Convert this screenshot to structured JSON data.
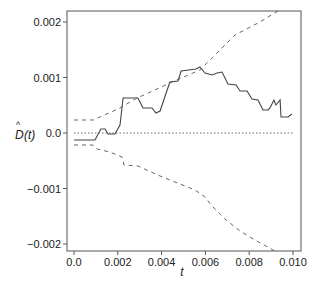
{
  "chart_data": {
    "type": "line",
    "title": "",
    "xlabel": "t",
    "ylabel": "D̂(t)",
    "xlim": [
      0.0,
      0.01
    ],
    "ylim": [
      -0.0021,
      0.0022
    ],
    "grid": false,
    "legend": null,
    "x_ticks": [
      {
        "value": 0.0,
        "label": "0.0"
      },
      {
        "value": 0.002,
        "label": "0.002"
      },
      {
        "value": 0.004,
        "label": "0.004"
      },
      {
        "value": 0.006,
        "label": "0.006"
      },
      {
        "value": 0.008,
        "label": "0.008"
      },
      {
        "value": 0.01,
        "label": "0.010"
      }
    ],
    "y_ticks": [
      {
        "value": 0.002,
        "label": "0.002"
      },
      {
        "value": 0.001,
        "label": "0.001"
      },
      {
        "value": 0.0,
        "label": "0.0"
      },
      {
        "value": -0.001,
        "label": "−0.001"
      },
      {
        "value": -0.002,
        "label": "−0.002"
      }
    ],
    "series": [
      {
        "name": "estimate",
        "style": "solid",
        "color": "#444444",
        "points": [
          [
            0.0,
            -0.000126
          ],
          [
            0.00096,
            -0.000126
          ],
          [
            0.00123,
            7.2e-05
          ],
          [
            0.00142,
            7.2e-05
          ],
          [
            0.00155,
            -1.8e-05
          ],
          [
            0.00187,
            -1.8e-05
          ],
          [
            0.0021,
            0.000144
          ],
          [
            0.00224,
            0.000631
          ],
          [
            0.00292,
            0.000631
          ],
          [
            0.00315,
            0.00045
          ],
          [
            0.00356,
            0.00045
          ],
          [
            0.00374,
            0.00036
          ],
          [
            0.00393,
            0.000396
          ],
          [
            0.00416,
            0.000667
          ],
          [
            0.00438,
            0.000919
          ],
          [
            0.00475,
            0.000937
          ],
          [
            0.00489,
            0.001117
          ],
          [
            0.00557,
            0.001153
          ],
          [
            0.00575,
            0.001189
          ],
          [
            0.00598,
            0.001081
          ],
          [
            0.0063,
            0.001045
          ],
          [
            0.00653,
            0.001081
          ],
          [
            0.00676,
            0.001099
          ],
          [
            0.00703,
            0.000883
          ],
          [
            0.0074,
            0.000865
          ],
          [
            0.00758,
            0.000757
          ],
          [
            0.0079,
            0.000757
          ],
          [
            0.00813,
            0.000613
          ],
          [
            0.0084,
            0.000595
          ],
          [
            0.00863,
            0.000414
          ],
          [
            0.00886,
            0.000414
          ],
          [
            0.00895,
            0.00045
          ],
          [
            0.00913,
            0.000595
          ],
          [
            0.00922,
            0.000504
          ],
          [
            0.00941,
            0.000595
          ],
          [
            0.00945,
            0.000288
          ],
          [
            0.00977,
            0.000288
          ],
          [
            0.00995,
            0.000342
          ]
        ]
      },
      {
        "name": "upper bound",
        "style": "dashed",
        "color": "#555555",
        "points": [
          [
            0.0,
            0.000234
          ],
          [
            0.00087,
            0.000234
          ],
          [
            0.0021,
            0.00045
          ],
          [
            0.00279,
            0.000613
          ],
          [
            0.00438,
            0.000901
          ],
          [
            0.00575,
            0.001135
          ],
          [
            0.00644,
            0.001405
          ],
          [
            0.00735,
            0.001766
          ],
          [
            0.00849,
            0.002
          ],
          [
            0.00932,
            0.0022
          ]
        ]
      },
      {
        "name": "lower bound",
        "style": "dashed",
        "color": "#555555",
        "points": [
          [
            0.0,
            -0.000216
          ],
          [
            0.00087,
            -0.000216
          ],
          [
            0.00105,
            -0.000288
          ],
          [
            0.00164,
            -0.000342
          ],
          [
            0.00219,
            -0.000432
          ],
          [
            0.00228,
            -0.000577
          ],
          [
            0.00292,
            -0.000595
          ],
          [
            0.00393,
            -0.000775
          ],
          [
            0.00461,
            -0.000883
          ],
          [
            0.00553,
            -0.001027
          ],
          [
            0.00598,
            -0.001153
          ],
          [
            0.0063,
            -0.001315
          ],
          [
            0.00689,
            -0.00155
          ],
          [
            0.00758,
            -0.001766
          ],
          [
            0.00826,
            -0.001928
          ],
          [
            0.00909,
            -0.002108
          ],
          [
            0.00922,
            -0.002144
          ]
        ]
      },
      {
        "name": "zero reference",
        "style": "dotted",
        "color": "#555555",
        "points": [
          [
            0.0,
            0.0
          ],
          [
            0.01,
            0.0
          ]
        ]
      }
    ]
  },
  "axes": {
    "x_label": "t",
    "y_label_base": "D",
    "y_label_hat": "^",
    "y_label_arg": "(t)"
  }
}
